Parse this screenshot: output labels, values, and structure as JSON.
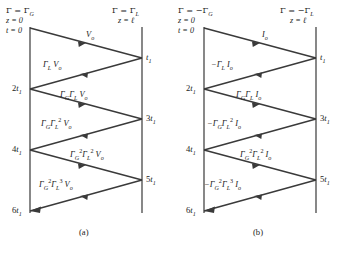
{
  "figure": {
    "type": "bounce-diagram-pair"
  },
  "panels": [
    {
      "id": "a",
      "caption": "(a)",
      "quantity": "voltage",
      "source_label": "V",
      "source_sub": "o",
      "left_boundary": {
        "gamma_text": "Γ = Γ",
        "gamma_sub": "G",
        "z_text": "z = 0",
        "t_text": "t = 0"
      },
      "right_boundary": {
        "gamma_text": "Γ = Γ",
        "gamma_sub": "L",
        "z_text": "z = ℓ"
      },
      "left_times": [
        "2t",
        "4t",
        "6t"
      ],
      "left_time_sub": "1",
      "right_times": [
        "t",
        "3t",
        "5t"
      ],
      "right_time_sub": "1",
      "rays": [
        {
          "index": 0,
          "dir": "right",
          "label_html": "V<sub>o</sub>"
        },
        {
          "index": 1,
          "dir": "left",
          "label_html": "Γ<sub>L</sub> V<sub>o</sub>"
        },
        {
          "index": 2,
          "dir": "right",
          "label_html": "Γ<sub>G</sub>Γ<sub>L</sub> V<sub>o</sub>"
        },
        {
          "index": 3,
          "dir": "left",
          "label_html": "Γ<sub>G</sub>Γ<sub>L</sub><sup>2</sup> V<sub>o</sub>"
        },
        {
          "index": 4,
          "dir": "right",
          "label_html": "Γ<sub>G</sub><sup>2</sup>Γ<sub>L</sub><sup>2</sup> V<sub>o</sub>"
        },
        {
          "index": 5,
          "dir": "left",
          "label_html": "Γ<sub>G</sub><sup>2</sup>Γ<sub>L</sub><sup>3</sup> V<sub>o</sub>"
        }
      ]
    },
    {
      "id": "b",
      "caption": "(b)",
      "quantity": "current",
      "source_label": "I",
      "source_sub": "o",
      "left_boundary": {
        "gamma_text": "Γ = −Γ",
        "gamma_sub": "G",
        "z_text": "z = 0",
        "t_text": "t = 0"
      },
      "right_boundary": {
        "gamma_text": "Γ = −Γ",
        "gamma_sub": "L",
        "z_text": "z = ℓ"
      },
      "left_times": [
        "2t",
        "4t",
        "6t"
      ],
      "left_time_sub": "1",
      "right_times": [
        "t",
        "3t",
        "5t"
      ],
      "right_time_sub": "1",
      "rays": [
        {
          "index": 0,
          "dir": "right",
          "label_html": "I<sub>o</sub>"
        },
        {
          "index": 1,
          "dir": "left",
          "label_html": "−Γ<sub>L</sub> I<sub>o</sub>"
        },
        {
          "index": 2,
          "dir": "right",
          "label_html": "Γ<sub>G</sub>Γ<sub>L</sub> I<sub>o</sub>"
        },
        {
          "index": 3,
          "dir": "left",
          "label_html": "−Γ<sub>G</sub>Γ<sub>L</sub><sup>2</sup> I<sub>o</sub>"
        },
        {
          "index": 4,
          "dir": "right",
          "label_html": "Γ<sub>G</sub><sup>2</sup>Γ<sub>L</sub><sup>2</sup> I<sub>o</sub>"
        },
        {
          "index": 5,
          "dir": "left",
          "label_html": "−Γ<sub>G</sub><sup>2</sup>Γ<sub>L</sub><sup>3</sup> I<sub>o</sub>"
        }
      ]
    }
  ],
  "colors": {
    "axis": "#555555",
    "ray": "#3a3a3a",
    "text": "#1b1b1b",
    "background": "#ffffff"
  }
}
